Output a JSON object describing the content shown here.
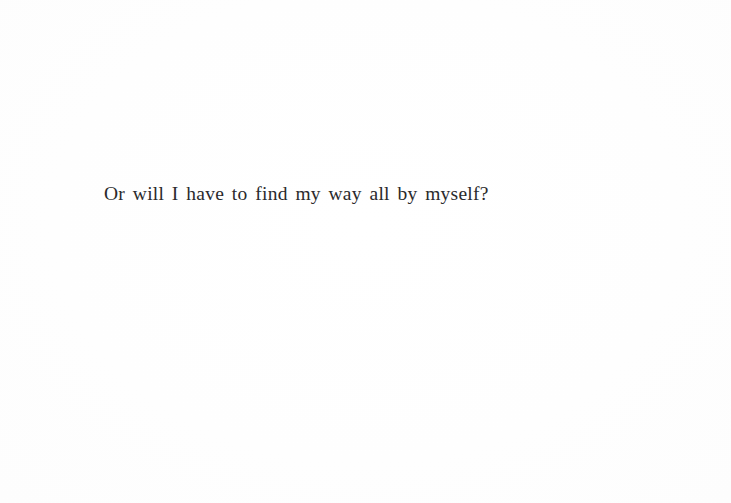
{
  "page": {
    "background_color": "#fefefe",
    "text_color": "#2a2a2c",
    "kind": "scanned-book-page"
  },
  "content": {
    "lines": [
      {
        "text": "Or will I have to find my way all by myself?"
      }
    ]
  }
}
